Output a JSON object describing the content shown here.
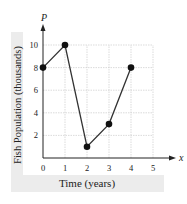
{
  "chart_data": {
    "type": "line",
    "title": "",
    "xlabel": "Time (years)",
    "ylabel": "Fish Population (thousands)",
    "x_axis_symbol": "x",
    "y_axis_symbol": "P",
    "x": [
      0,
      1,
      2,
      3,
      4
    ],
    "values": [
      8,
      10,
      1,
      3,
      8
    ],
    "xlim": [
      0,
      5
    ],
    "ylim": [
      0,
      10
    ],
    "x_ticks": [
      "0",
      "1",
      "2",
      "3",
      "4",
      "5"
    ],
    "y_ticks": [
      "2",
      "4",
      "6",
      "8",
      "10"
    ],
    "grid": true,
    "markers": true,
    "legend": null
  },
  "colors": {
    "line": "#333333",
    "grid": "#cccccc",
    "label_band": "#ececec"
  }
}
